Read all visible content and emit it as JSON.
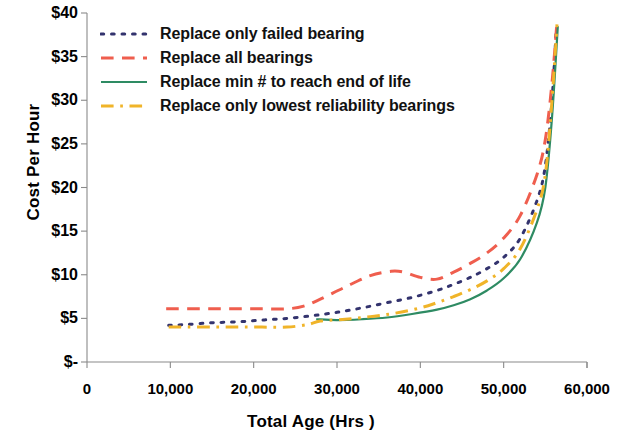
{
  "chart_data": {
    "type": "line",
    "title": "",
    "xlabel": "Total Age (Hrs )",
    "ylabel": "Cost Per Hour",
    "xlim": [
      0,
      60000
    ],
    "ylim": [
      0,
      40
    ],
    "grid": false,
    "legend_position": "top-left inside plot",
    "x_ticks": [
      {
        "value": 0,
        "label": "0"
      },
      {
        "value": 10000,
        "label": "10,000"
      },
      {
        "value": 20000,
        "label": "20,000"
      },
      {
        "value": 30000,
        "label": "30,000"
      },
      {
        "value": 40000,
        "label": "40,000"
      },
      {
        "value": 50000,
        "label": "50,000"
      },
      {
        "value": 60000,
        "label": "60,000"
      }
    ],
    "y_ticks": [
      {
        "value": 40,
        "label": "$40"
      },
      {
        "value": 35,
        "label": "$35"
      },
      {
        "value": 30,
        "label": "$30"
      },
      {
        "value": 25,
        "label": "$25"
      },
      {
        "value": 20,
        "label": "$20"
      },
      {
        "value": 15,
        "label": "$15"
      },
      {
        "value": 10,
        "label": "$10"
      },
      {
        "value": 5,
        "label": "$5"
      },
      {
        "value": 0,
        "label": "$-"
      }
    ],
    "series": [
      {
        "name": "Replace only failed bearing",
        "color": "#33336e",
        "style": "dotted",
        "x": [
          9800,
          12000,
          15000,
          18000,
          21000,
          24000,
          27000,
          30000,
          33000,
          36000,
          39000,
          42000,
          44000,
          46000,
          48000,
          50000,
          52000,
          54000,
          55000,
          55800,
          56300
        ],
        "y": [
          4.2,
          4.3,
          4.5,
          4.6,
          4.8,
          5.0,
          5.3,
          5.7,
          6.2,
          6.8,
          7.4,
          8.2,
          8.9,
          9.7,
          10.7,
          12.0,
          14.2,
          18.5,
          22.5,
          30.0,
          38.0
        ]
      },
      {
        "name": "Replace all bearings",
        "color": "#ef5e4e",
        "style": "dashed",
        "x": [
          9500,
          12000,
          15000,
          18000,
          21000,
          24000,
          26000,
          28000,
          31000,
          34000,
          36500,
          38000,
          40000,
          42000,
          44000,
          46000,
          48000,
          50000,
          52000,
          54000,
          55000,
          55800,
          56400
        ],
        "y": [
          6.1,
          6.1,
          6.1,
          6.1,
          6.1,
          6.1,
          6.4,
          7.2,
          8.6,
          9.9,
          10.4,
          10.3,
          9.7,
          9.5,
          10.3,
          11.3,
          12.5,
          14.2,
          16.8,
          21.5,
          25.5,
          32.0,
          39.0
        ]
      },
      {
        "name": "Replace min # to reach end of life",
        "color": "#2e8b63",
        "style": "solid",
        "x": [
          27500,
          30000,
          33000,
          36000,
          39000,
          42000,
          44000,
          46000,
          48000,
          50000,
          52000,
          54000,
          55000,
          55800,
          56500
        ],
        "y": [
          4.9,
          4.8,
          4.9,
          5.1,
          5.5,
          6.0,
          6.5,
          7.2,
          8.2,
          9.6,
          11.8,
          16.0,
          20.0,
          28.0,
          38.5
        ]
      },
      {
        "name": "Replace only lowest reliability bearings",
        "color": "#f0b429",
        "style": "dash-dot",
        "x": [
          9800,
          12000,
          15000,
          18000,
          21000,
          24000,
          26500,
          28000,
          31000,
          34000,
          37000,
          40000,
          42000,
          44000,
          46000,
          48000,
          50000,
          52000,
          54000,
          55000,
          55800,
          56400
        ],
        "y": [
          4.0,
          4.0,
          4.0,
          4.0,
          4.0,
          4.0,
          4.3,
          4.7,
          4.9,
          5.2,
          5.6,
          6.2,
          6.8,
          7.5,
          8.3,
          9.3,
          10.7,
          13.0,
          17.5,
          21.5,
          30.0,
          38.7
        ]
      }
    ]
  },
  "legend": {
    "items": [
      {
        "label": "Replace only failed bearing"
      },
      {
        "label": "Replace all bearings"
      },
      {
        "label": "Replace min # to reach end of life"
      },
      {
        "label": "Replace only lowest reliability bearings"
      }
    ]
  },
  "axes": {
    "axis_color": "#8a8a8a",
    "baseline_color": "#8a8a8a"
  }
}
